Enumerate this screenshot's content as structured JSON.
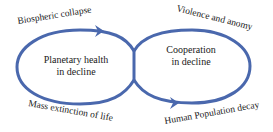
{
  "diagram": {
    "type": "figure-eight cycle",
    "loops": [
      {
        "id": "left",
        "center_label_line1": "Planetary health",
        "center_label_line2": "in decline"
      },
      {
        "id": "right",
        "center_label_line1": "Cooperation",
        "center_label_line2": "in decline"
      }
    ],
    "annotations": {
      "top_left": "Biospheric collapse",
      "top_right": "Violence and anomy",
      "bottom_left": "Mass extinction of life",
      "bottom_right": "Human Population decay"
    },
    "colors": {
      "loop_stroke": "#4a68ad",
      "text": "#1a1a1a",
      "background": "#ffffff"
    }
  }
}
